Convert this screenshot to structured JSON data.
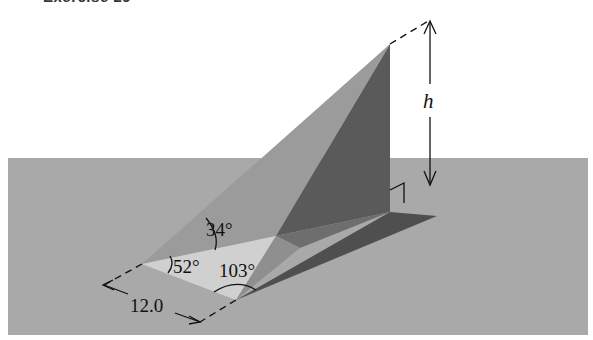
{
  "title": "Exercise 29",
  "labels": {
    "height": "h",
    "angle_top": "34°",
    "angle_left": "52°",
    "angle_bottom": "103°",
    "base_length": "12.0"
  },
  "colors": {
    "ground": "#a9a9a9",
    "sloped_face": "#9c9c9c",
    "dark_face": "#595959",
    "light_triangle": "#cfcfcf",
    "shadow": "#4e4e4e",
    "line": "#111111"
  }
}
